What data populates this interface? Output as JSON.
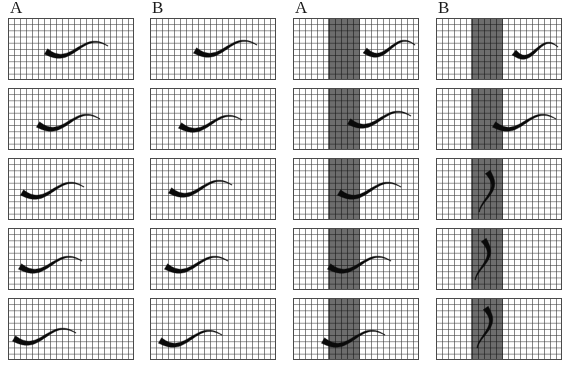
{
  "figure": {
    "type": "time-lapse-locomotion-panels",
    "rows": 5,
    "columns": 4,
    "panel_grid": {
      "cols": 21,
      "rows": 10
    },
    "colors": {
      "background": "#ffffff",
      "grid_line": "#3c3c3c",
      "panel_border": "#4a4a4a",
      "worm_body": "#0a0a0a",
      "barrier_band": "#484848"
    }
  },
  "columns": [
    {
      "id": "col-1",
      "label": "A",
      "has_barrier": false,
      "x": 8,
      "frames": [
        {
          "index": 1,
          "orientation": "horizontal",
          "head_x": 38,
          "head_y": 31,
          "description": "worm mid-panel, head left, sinusoidal body extending right"
        },
        {
          "index": 2,
          "orientation": "horizontal",
          "head_x": 30,
          "head_y": 34,
          "description": "worm shifted left, long thin tail to right"
        },
        {
          "index": 3,
          "orientation": "horizontal",
          "head_x": 14,
          "head_y": 32,
          "description": "worm at left edge, body crest mid-panel, tail curves down-right"
        },
        {
          "index": 4,
          "orientation": "horizontal",
          "head_x": 12,
          "head_y": 36,
          "description": "worm low-left, tail sweeping up to the right"
        },
        {
          "index": 5,
          "orientation": "horizontal",
          "head_x": 6,
          "head_y": 38,
          "description": "worm at far left, shallow wave, thin tail up-right"
        }
      ]
    },
    {
      "id": "col-2",
      "label": "B",
      "has_barrier": false,
      "x": 150,
      "frames": [
        {
          "index": 1,
          "orientation": "horizontal",
          "head_x": 45,
          "head_y": 30,
          "description": "worm centered, tail hooking sharply upward at right edge"
        },
        {
          "index": 2,
          "orientation": "horizontal",
          "head_x": 30,
          "head_y": 35,
          "description": "worm left-of-center, tail rising at right"
        },
        {
          "index": 3,
          "orientation": "horizontal",
          "head_x": 20,
          "head_y": 30,
          "description": "worm left, deep body wave, tail dropping down-right"
        },
        {
          "index": 4,
          "orientation": "horizontal",
          "head_x": 16,
          "head_y": 36,
          "description": "worm low-left, tail arcing up to mid-right"
        },
        {
          "index": 5,
          "orientation": "horizontal",
          "head_x": 10,
          "head_y": 40,
          "description": "worm far-left low, crest mid-panel, short tail up-right"
        }
      ]
    },
    {
      "id": "col-3",
      "label": "A",
      "has_barrier": true,
      "x": 293,
      "barrier": {
        "left_pct": 28,
        "width_pct": 25
      },
      "frames": [
        {
          "index": 1,
          "orientation": "horizontal",
          "head_x": 72,
          "head_y": 30,
          "description": "worm fully right of the barrier band, head at band edge"
        },
        {
          "index": 2,
          "orientation": "horizontal",
          "head_x": 56,
          "head_y": 31,
          "description": "worm head touching right edge of barrier band"
        },
        {
          "index": 3,
          "orientation": "horizontal",
          "head_x": 46,
          "head_y": 32,
          "description": "worm head entering the barrier band"
        },
        {
          "index": 4,
          "orientation": "horizontal",
          "head_x": 36,
          "head_y": 36,
          "description": "worm head well inside the barrier band, tail trailing right"
        },
        {
          "index": 5,
          "orientation": "horizontal",
          "head_x": 30,
          "head_y": 40,
          "description": "worm crossing the band, body spanning it, thin tail to the right"
        }
      ]
    },
    {
      "id": "col-4",
      "label": "B",
      "has_barrier": true,
      "x": 436,
      "barrier": {
        "left_pct": 28,
        "width_pct": 25
      },
      "frames": [
        {
          "index": 1,
          "orientation": "horizontal",
          "head_x": 78,
          "head_y": 32,
          "description": "worm far right of the barrier band"
        },
        {
          "index": 2,
          "orientation": "horizontal",
          "head_x": 58,
          "head_y": 34,
          "description": "worm approaching the barrier band from the right"
        },
        {
          "index": 3,
          "orientation": "vertical",
          "head_x": 50,
          "head_y": 14,
          "description": "worm reoriented vertically, head high inside band, body descending"
        },
        {
          "index": 4,
          "orientation": "vertical",
          "head_x": 46,
          "head_y": 12,
          "description": "worm vertical inside band, head top, long tail curving down-right"
        },
        {
          "index": 5,
          "orientation": "vertical",
          "head_x": 48,
          "head_y": 10,
          "description": "worm vertical along band, head at top edge, tail sweeping down-right"
        }
      ]
    }
  ]
}
